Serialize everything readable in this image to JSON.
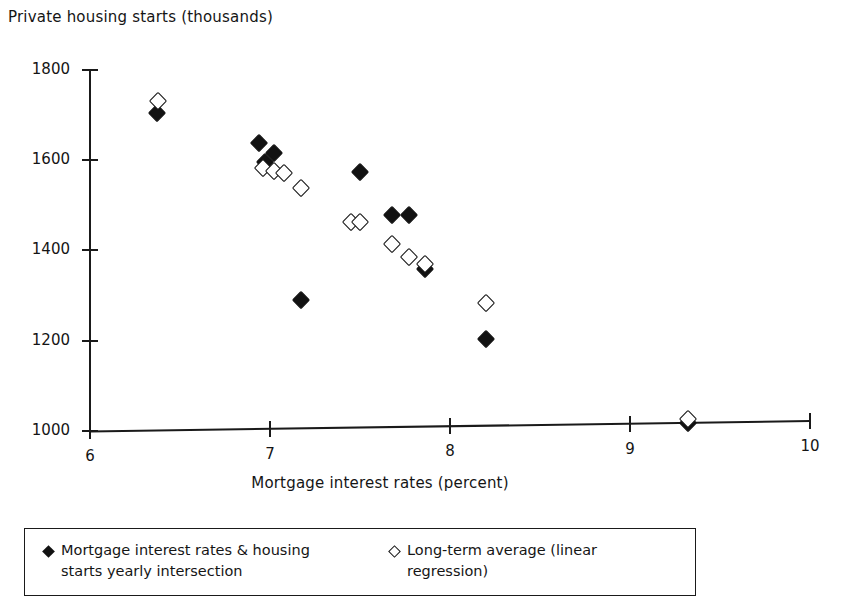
{
  "chart_data": {
    "type": "scatter",
    "title": "",
    "ylabel": "Private housing starts (thousands)",
    "xlabel": "Mortgage interest rates (percent)",
    "xlim": [
      6,
      10
    ],
    "ylim": [
      1000,
      1800
    ],
    "xticks": [
      6,
      7,
      8,
      9,
      10
    ],
    "yticks": [
      1000,
      1200,
      1400,
      1600,
      1800
    ],
    "xtick_labels": [
      "6",
      "7",
      "8",
      "9",
      "10"
    ],
    "ytick_labels": [
      "1000",
      "1200",
      "1400",
      "1600",
      "1800"
    ],
    "grid": false,
    "legend_position": "below-plot",
    "series": [
      {
        "name": "Mortgage interest rates & housing starts yearly intersection",
        "marker": "filled-diamond",
        "color": "#121212",
        "points": [
          {
            "x": 6.37,
            "y": 1706
          },
          {
            "x": 6.94,
            "y": 1643
          },
          {
            "x": 7.02,
            "y": 1622
          },
          {
            "x": 6.97,
            "y": 1602
          },
          {
            "x": 7.17,
            "y": 1297
          },
          {
            "x": 7.5,
            "y": 1583
          },
          {
            "x": 7.68,
            "y": 1489
          },
          {
            "x": 7.77,
            "y": 1489
          },
          {
            "x": 7.86,
            "y": 1371
          },
          {
            "x": 8.2,
            "y": 1216
          },
          {
            "x": 9.32,
            "y": 1038
          }
        ]
      },
      {
        "name": "Long-term average (linear regression)",
        "marker": "open-diamond",
        "color": "#141414",
        "points": [
          {
            "x": 6.38,
            "y": 1733
          },
          {
            "x": 6.96,
            "y": 1589
          },
          {
            "x": 7.02,
            "y": 1583
          },
          {
            "x": 7.08,
            "y": 1578
          },
          {
            "x": 7.17,
            "y": 1546
          },
          {
            "x": 7.45,
            "y": 1472
          },
          {
            "x": 7.5,
            "y": 1471
          },
          {
            "x": 7.68,
            "y": 1424
          },
          {
            "x": 7.77,
            "y": 1396
          },
          {
            "x": 7.86,
            "y": 1381
          },
          {
            "x": 8.2,
            "y": 1297
          },
          {
            "x": 9.32,
            "y": 1045
          }
        ]
      }
    ]
  },
  "legend": {
    "entries": [
      {
        "marker": "filled-diamond",
        "line1": "Mortgage interest rates & housing",
        "line2": "starts yearly intersection"
      },
      {
        "marker": "open-diamond",
        "line1": "Long-term average (linear",
        "line2": "regression)"
      }
    ]
  }
}
